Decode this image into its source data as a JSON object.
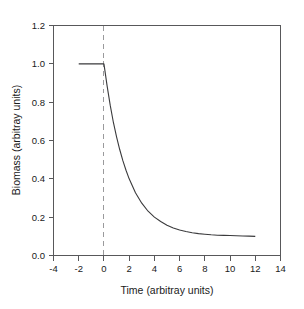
{
  "chart_data": {
    "type": "line",
    "title": "",
    "subtitle": "",
    "xlabel": "Time (arbitray units)",
    "ylabel": "Biomass (arbitray units)",
    "xlim": [
      -4,
      14
    ],
    "ylim": [
      0.0,
      1.2
    ],
    "grid": false,
    "legend": null,
    "xticks": [
      "-4",
      "-2",
      "0",
      "2",
      "4",
      "6",
      "8",
      "10",
      "12",
      "14"
    ],
    "xtick_values": [
      -4,
      -2,
      0,
      2,
      4,
      6,
      8,
      10,
      12,
      14
    ],
    "yticks": [
      "0.0",
      "0.2",
      "0.4",
      "0.6",
      "0.8",
      "1.0",
      "1.2"
    ],
    "ytick_values": [
      0.0,
      0.2,
      0.4,
      0.6,
      0.8,
      1.0,
      1.2
    ],
    "series": [
      {
        "name": "Biomass",
        "color": "#3a3a3c",
        "style": "solid",
        "x": [
          -2.0,
          -1.5,
          -1.0,
          -0.5,
          0.0,
          0.25,
          0.5,
          0.75,
          1.0,
          1.25,
          1.5,
          1.75,
          2.0,
          2.5,
          3.0,
          3.5,
          4.0,
          4.5,
          5.0,
          5.5,
          6.0,
          6.5,
          7.0,
          7.5,
          8.0,
          8.5,
          9.0,
          9.5,
          10.0,
          10.5,
          11.0,
          11.5,
          12.0
        ],
        "values": [
          1.0,
          1.0,
          1.0,
          1.0,
          1.0,
          0.885,
          0.783,
          0.694,
          0.619,
          0.553,
          0.495,
          0.445,
          0.4,
          0.327,
          0.273,
          0.231,
          0.2,
          0.177,
          0.158,
          0.144,
          0.133,
          0.125,
          0.119,
          0.114,
          0.111,
          0.108,
          0.106,
          0.105,
          0.104,
          0.103,
          0.102,
          0.101,
          0.1
        ]
      }
    ],
    "annotations": [
      {
        "name": "event-line",
        "type": "vline",
        "x": 0,
        "style": "dashed",
        "color": "#9a9a9c",
        "label": ""
      }
    ]
  },
  "axes": {
    "x_title": "Time (arbitray units)",
    "y_title": "Biomass (arbitray units)"
  }
}
